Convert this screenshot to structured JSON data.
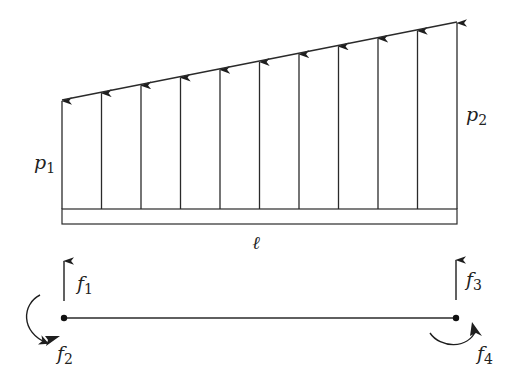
{
  "diagram": {
    "colors": {
      "stroke": "#2a2a2a",
      "background": "#ffffff"
    },
    "load": {
      "left_label": {
        "main": "p",
        "sub": "1"
      },
      "right_label": {
        "main": "p",
        "sub": "2"
      },
      "arrow_count": 11,
      "left_top_y": 100,
      "right_top_y": 22,
      "base_y": 209,
      "x_start": 62,
      "x_end": 457
    },
    "beam": {
      "top_y": 209,
      "bottom_y": 224,
      "length_label": "ℓ"
    },
    "element": {
      "line_y": 318,
      "left_node_x": 64,
      "right_node_x": 456,
      "forces": [
        {
          "main": "f",
          "sub": "1",
          "type": "vertical-force",
          "node": "left"
        },
        {
          "main": "f",
          "sub": "2",
          "type": "moment",
          "node": "left"
        },
        {
          "main": "f",
          "sub": "3",
          "type": "vertical-force",
          "node": "right"
        },
        {
          "main": "f",
          "sub": "4",
          "type": "moment",
          "node": "right"
        }
      ]
    }
  }
}
